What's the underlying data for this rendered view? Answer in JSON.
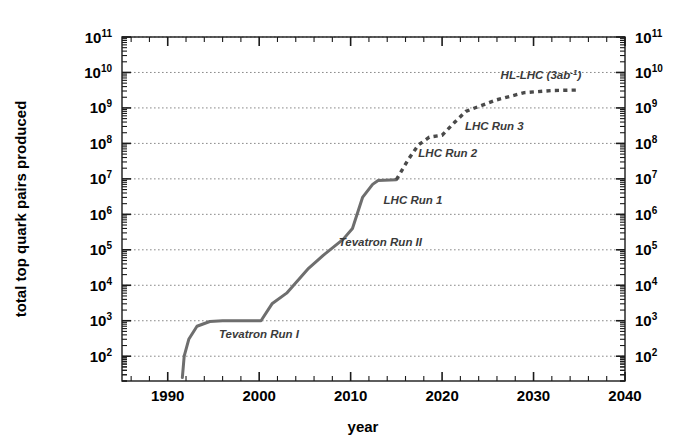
{
  "chart_data": {
    "type": "line",
    "title": "",
    "xlabel": "year",
    "ylabel": "total top quark pairs produced",
    "xlim": [
      1985,
      2040
    ],
    "ylim": [
      20,
      100000000000
    ],
    "yscale": "log",
    "grid": "horizontal-dotted-at-decades",
    "legend": "none",
    "x_ticks_major": [
      1990,
      2000,
      2010,
      2020,
      2030,
      2040
    ],
    "x_ticks_major_labels": [
      "1990",
      "2000",
      "2010",
      "2020",
      "2030",
      "2040"
    ],
    "x_tick_minor_step": 2,
    "y_ticks_major": [
      100,
      1000,
      10000,
      100000,
      1000000,
      10000000,
      100000000,
      1000000000,
      10000000000,
      100000000000
    ],
    "y_ticks_major_labels": [
      "10^2",
      "10^3",
      "10^4",
      "10^5",
      "10^6",
      "10^7",
      "10^8",
      "10^9",
      "10^10",
      "10^11"
    ],
    "y_tick_label_mantissa": "10",
    "y_tick_label_exponents": [
      "2",
      "3",
      "4",
      "5",
      "6",
      "7",
      "8",
      "9",
      "10",
      "11"
    ],
    "series": [
      {
        "name": "measured (solid)",
        "style": "solid",
        "color": "#6e6e6e",
        "points": [
          {
            "x": 1991.6,
            "y": 25
          },
          {
            "x": 1991.8,
            "y": 100
          },
          {
            "x": 1992.3,
            "y": 300
          },
          {
            "x": 1993.2,
            "y": 700
          },
          {
            "x": 1994.6,
            "y": 950
          },
          {
            "x": 1996.0,
            "y": 1000
          },
          {
            "x": 2000.2,
            "y": 1000
          },
          {
            "x": 2001.4,
            "y": 3000
          },
          {
            "x": 2003.0,
            "y": 6000
          },
          {
            "x": 2005.4,
            "y": 30000
          },
          {
            "x": 2007.0,
            "y": 70000
          },
          {
            "x": 2009.2,
            "y": 200000
          },
          {
            "x": 2010.2,
            "y": 400000
          },
          {
            "x": 2011.3,
            "y": 3000000
          },
          {
            "x": 2012.4,
            "y": 7000000
          },
          {
            "x": 2013.0,
            "y": 9000000
          },
          {
            "x": 2015.0,
            "y": 9500000
          }
        ]
      },
      {
        "name": "projected (dotted)",
        "style": "dotted",
        "color": "#4a4a4a",
        "points": [
          {
            "x": 2015.0,
            "y": 9500000
          },
          {
            "x": 2016.3,
            "y": 35000000
          },
          {
            "x": 2017.4,
            "y": 90000000
          },
          {
            "x": 2018.6,
            "y": 150000000
          },
          {
            "x": 2020.0,
            "y": 170000000
          },
          {
            "x": 2021.4,
            "y": 400000000
          },
          {
            "x": 2022.6,
            "y": 800000000
          },
          {
            "x": 2024.0,
            "y": 1100000000
          },
          {
            "x": 2026.0,
            "y": 1700000000
          },
          {
            "x": 2029.0,
            "y": 2700000000
          },
          {
            "x": 2032.0,
            "y": 3100000000
          },
          {
            "x": 2035.0,
            "y": 3200000000
          }
        ]
      }
    ],
    "annotations": [
      {
        "text": "Tevatron Run I",
        "x": 1995.6,
        "y": 330,
        "name": "annotation-tevatron-run-1"
      },
      {
        "text": "Tevatron Run II",
        "x": 2008.7,
        "y": 130000,
        "name": "annotation-tevatron-run-2"
      },
      {
        "text": "LHC Run 1",
        "x": 2013.6,
        "y": 1900000,
        "name": "annotation-lhc-run-1"
      },
      {
        "text": "LHC Run 2",
        "x": 2017.4,
        "y": 42000000,
        "name": "annotation-lhc-run-2"
      },
      {
        "text": "LHC Run 3",
        "x": 2022.5,
        "y": 240000000,
        "name": "annotation-lhc-run-3"
      },
      {
        "text": "HL-LHC (3ab",
        "x": 2026.4,
        "y": 6500000000,
        "sup": "-1",
        "tail": ")",
        "name": "annotation-hl-lhc"
      }
    ]
  },
  "axes": {
    "xlabel": "year",
    "ylabel": "total top quark pairs produced",
    "left_tick_labels": [
      "10",
      "10",
      "10",
      "10",
      "10",
      "10",
      "10",
      "10",
      "10",
      "10"
    ],
    "left_tick_exps": [
      "11",
      "10",
      "9",
      "8",
      "7",
      "6",
      "5",
      "4",
      "3",
      "2"
    ],
    "right_tick_labels": [
      "10",
      "10",
      "10",
      "10",
      "10",
      "10",
      "10",
      "10",
      "10",
      "10"
    ],
    "right_tick_exps": [
      "11",
      "10",
      "9",
      "8",
      "7",
      "6",
      "5",
      "4",
      "3",
      "2"
    ],
    "x_tick_labels": [
      "1990",
      "2000",
      "2010",
      "2020",
      "2030",
      "2040"
    ]
  },
  "style": {
    "line_color": "#6e6e6e",
    "dot_color": "#4a4a4a",
    "axis_color": "#1a1a1a",
    "grid_color": "#8a8a8a",
    "background": "#ffffff",
    "text_color": "#000000",
    "annot_color": "#3a3a3a"
  }
}
